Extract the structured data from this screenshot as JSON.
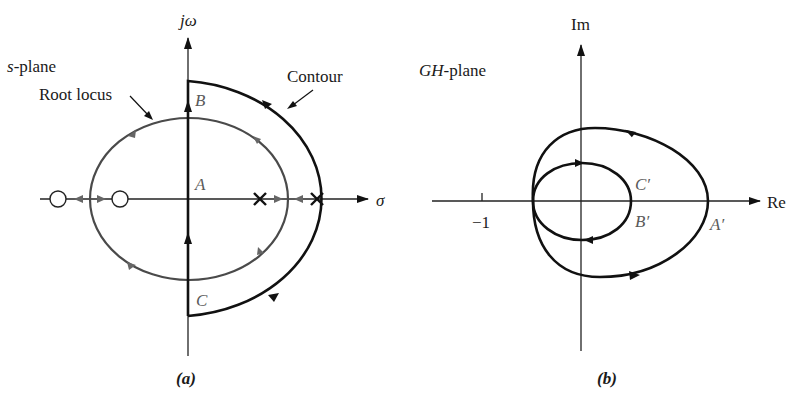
{
  "panel_a": {
    "caption": "(a)",
    "plane_label": "s-plane",
    "plane_label_var": "s",
    "plane_label_suffix": "-plane",
    "y_axis_label": "jω",
    "x_axis_label": "σ",
    "root_locus_label": "Root locus",
    "contour_label": "Contour",
    "points": {
      "A": "A",
      "B": "B",
      "C": "C"
    },
    "zeros_count": 2,
    "poles_count": 2,
    "colors": {
      "contour": "#111111",
      "root_locus": "#4a4a4a",
      "axes": "#222222"
    }
  },
  "panel_b": {
    "caption": "(b)",
    "plane_label_var": "GH",
    "plane_label_suffix": "-plane",
    "y_axis_label": "Im",
    "x_axis_label": "Re",
    "tick_label": "−1",
    "points": {
      "A_prime": "A′",
      "B_prime": "B′",
      "C_prime": "C′"
    },
    "colors": {
      "curve": "#111111",
      "axes": "#222222"
    }
  }
}
